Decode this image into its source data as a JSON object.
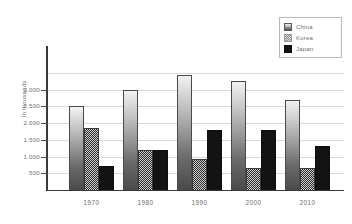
{
  "chart_data": {
    "type": "bar",
    "title": "",
    "xlabel": "",
    "ylabel": "In thousands",
    "categories": [
      "1970",
      "1980",
      "1990",
      "2000",
      "2010"
    ],
    "series": [
      {
        "name": "China",
        "values": [
          2500,
          3000,
          3450,
          3250,
          2700
        ]
      },
      {
        "name": "Korea",
        "values": [
          1870,
          1200,
          920,
          660,
          650
        ]
      },
      {
        "name": "Japan",
        "values": [
          720,
          1210,
          1800,
          1790,
          1310
        ]
      }
    ],
    "ylim": [
      0,
      3700
    ],
    "yticks": [
      500,
      1000,
      1500,
      2000,
      2500,
      3000
    ],
    "ytick_labels": [
      "500",
      "1.000",
      "1.500",
      "2.000",
      "2.500",
      "3.000"
    ],
    "gridlines": [
      500,
      1000,
      1500,
      2000,
      2500,
      3000,
      3500
    ],
    "grid": true,
    "legend_position": "top-right"
  },
  "legend": {
    "items": [
      {
        "label": "China",
        "pattern": "gradient",
        "color": "#8a8a8a"
      },
      {
        "label": "Korea",
        "pattern": "checker",
        "color": "#cfcfcf"
      },
      {
        "label": "Japan",
        "pattern": "solid",
        "color": "#131313"
      }
    ]
  },
  "axes": {
    "y_title": "In thousands",
    "y_tick_labels": [
      "3.000",
      "2.500",
      "2.000",
      "1.500",
      "1.000",
      "500"
    ],
    "x_tick_labels": [
      "1970",
      "1980",
      "1990",
      "2000",
      "2010"
    ]
  },
  "colors": {
    "grid": "#d9d9d9",
    "axis": "#3a3a3a",
    "text": "#6f6f6f",
    "background": "#ffffff"
  }
}
